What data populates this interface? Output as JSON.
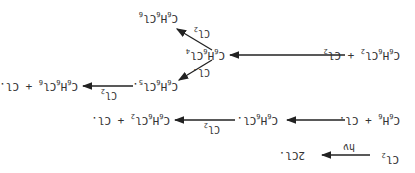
{
  "diagram": {
    "orientation": "rotated 180 degrees",
    "reactions": [
      {
        "id": "initiation",
        "reactant": "Cl2",
        "product": "2Cl.",
        "condition": "hν"
      },
      {
        "id": "propagation-1",
        "reactant": "C6H6 + Cl.",
        "intermediate": "C6H6Cl.",
        "reagent": "Cl2",
        "product": "C6H6Cl2 + Cl."
      },
      {
        "id": "addition-2",
        "reactant": "C6H6Cl2 + Cl2",
        "product": "C6H6Cl4"
      },
      {
        "id": "branch-a",
        "reactant": "C6H6Cl4",
        "reagent": "Cl2",
        "product": "C6H6Cl6"
      },
      {
        "id": "branch-b",
        "reactant": "C6H6Cl4",
        "reagent": "Cl.",
        "product": "C6H6Cl5."
      },
      {
        "id": "branch-b-2",
        "reactant": "C6H6Cl5.",
        "reagent": "Cl2",
        "product": "C6H6Cl6 + Cl."
      }
    ]
  },
  "labels": {
    "cl2": "Cl",
    "sub2": "2",
    "two_cl": "2Cl.",
    "hv": "hν",
    "c": "C",
    "h": "H",
    "cl": "Cl",
    "six": "6",
    "four": "4",
    "five": "5",
    "plus": "+",
    "cl_radical": "Cl.",
    "dot": "."
  }
}
